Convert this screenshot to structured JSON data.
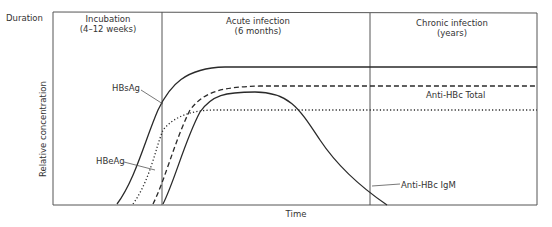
{
  "figure": {
    "duration_label": "Duration",
    "y_axis_label": "Relative concentration",
    "x_axis_label": "Time",
    "phases": [
      {
        "title": "Incubation",
        "subtitle": "(4–12 weeks)"
      },
      {
        "title": "Acute infection",
        "subtitle": "(6 months)"
      },
      {
        "title": "Chronic infection",
        "subtitle": "(years)"
      }
    ],
    "curves": [
      {
        "name": "HBsAg",
        "style": "solid"
      },
      {
        "name": "HBeAg",
        "style": "dotted"
      },
      {
        "name": "Anti-HBc Total",
        "style": "dashed"
      },
      {
        "name": "Anti-HBc IgM",
        "style": "solid"
      }
    ],
    "colors": {
      "line": "#2a2a2a",
      "frame": "#555555",
      "background": "#ffffff"
    }
  }
}
